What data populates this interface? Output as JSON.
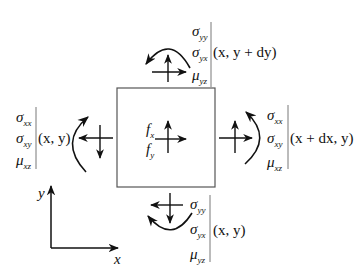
{
  "diagram": {
    "element": {
      "body_forces": [
        {
          "symbol": "f",
          "sub": "x"
        },
        {
          "symbol": "f",
          "sub": "y"
        }
      ]
    },
    "top_face": {
      "components": [
        {
          "symbol": "σ",
          "sub": "yy"
        },
        {
          "symbol": "σ",
          "sub": "yx"
        },
        {
          "symbol": "μ",
          "sub": "yz"
        }
      ],
      "coord": "(x, y + dy)"
    },
    "bottom_face": {
      "components": [
        {
          "symbol": "σ",
          "sub": "yy"
        },
        {
          "symbol": "σ",
          "sub": "yx"
        },
        {
          "symbol": "μ",
          "sub": "yz"
        }
      ],
      "coord": "(x, y)"
    },
    "left_face": {
      "components": [
        {
          "symbol": "σ",
          "sub": "xx"
        },
        {
          "symbol": "σ",
          "sub": "xy"
        },
        {
          "symbol": "μ",
          "sub": "xz"
        }
      ],
      "coord": "(x, y)"
    },
    "right_face": {
      "components": [
        {
          "symbol": "σ",
          "sub": "xx"
        },
        {
          "symbol": "σ",
          "sub": "xy"
        },
        {
          "symbol": "μ",
          "sub": "xz"
        }
      ],
      "coord": "(x + dx, y)"
    },
    "axes": {
      "x_label": "x",
      "y_label": "y"
    },
    "colors": {
      "stroke": "#111111",
      "box": "#555555"
    }
  }
}
